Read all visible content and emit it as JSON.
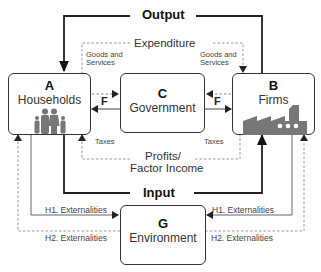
{
  "flows": {
    "output": "Output",
    "input": "Input",
    "expenditure": "Expenditure",
    "profits": "Profits/\nFactor Income",
    "profits_line1": "Profits/",
    "profits_line2": "Factor Income",
    "goods_left_1": "Goods and",
    "goods_left_2": "Services",
    "goods_right_1": "Goods and",
    "goods_right_2": "Services",
    "taxes_left": "Taxes",
    "taxes_right": "Taxes",
    "f_left": "F",
    "f_right": "F",
    "h1_left": "H1. Externalities",
    "h1_right": "H1. Externalities",
    "h2_left": "H2. Externalities",
    "h2_right": "H2. Externalities"
  },
  "nodes": {
    "households": {
      "letter": "A",
      "name": "Households",
      "icon": "family-icon"
    },
    "firms": {
      "letter": "B",
      "name": "Firms",
      "icon": "factory-icon"
    },
    "government": {
      "letter": "C",
      "name": "Government"
    },
    "environment": {
      "letter": "G",
      "name": "Environment"
    }
  },
  "colors": {
    "line": "#333333",
    "dashed": "#888888",
    "icon": "#777777"
  }
}
